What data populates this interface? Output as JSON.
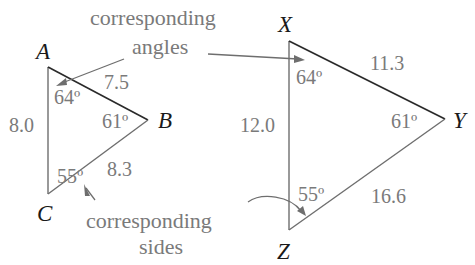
{
  "figure": {
    "colors": {
      "dark_edge": "#2a2a2a",
      "grey_text": "#7a7a7a",
      "arrow": "#6e6e6e"
    }
  },
  "annotations": {
    "angles_line1": "corresponding",
    "angles_line2": "angles",
    "sides_line1": "corresponding",
    "sides_line2": "sides"
  },
  "triangle_abc": {
    "vertices": {
      "a": "A",
      "b": "B",
      "c": "C"
    },
    "angles": {
      "a": "64º",
      "b": "61º",
      "c": "55º"
    },
    "sides": {
      "ab": "7.5",
      "bc": "8.3",
      "ac": "8.0"
    }
  },
  "triangle_xyz": {
    "vertices": {
      "x": "X",
      "y": "Y",
      "z": "Z"
    },
    "angles": {
      "x": "64º",
      "y": "61º",
      "z": "55º"
    },
    "sides": {
      "xy": "11.3",
      "yz": "16.6",
      "xz": "12.0"
    }
  }
}
